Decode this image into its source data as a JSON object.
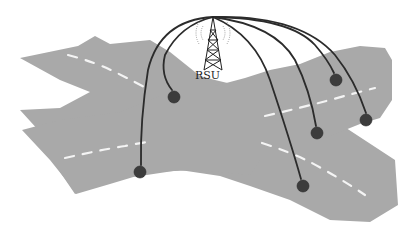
{
  "diagram": {
    "rsu": {
      "label": "RSU",
      "icon": "radio-tower-icon",
      "position": {
        "x": 213,
        "y": 17
      }
    },
    "colors": {
      "road": "#a9a9a9",
      "lane_marking": "#f4f4f4",
      "vehicle": "#3c3c3c",
      "link": "#2b2b2b",
      "background": "#ffffff"
    },
    "roads": [
      {
        "name": "diagonal-road-nw-se",
        "direction": "upper-left to lower-right"
      },
      {
        "name": "diagonal-road-sw-ne",
        "direction": "lower-left to upper-right"
      }
    ],
    "vehicles": [
      {
        "id": "v1",
        "x": 174,
        "y": 97
      },
      {
        "id": "v2",
        "x": 140,
        "y": 172
      },
      {
        "id": "v3",
        "x": 336,
        "y": 80
      },
      {
        "id": "v4",
        "x": 366,
        "y": 120
      },
      {
        "id": "v5",
        "x": 317,
        "y": 133
      },
      {
        "id": "v6",
        "x": 303,
        "y": 186
      }
    ],
    "links": [
      {
        "from": "rsu",
        "to": "v1"
      },
      {
        "from": "rsu",
        "to": "v2"
      },
      {
        "from": "rsu",
        "to": "v3"
      },
      {
        "from": "rsu",
        "to": "v4"
      },
      {
        "from": "rsu",
        "to": "v5"
      },
      {
        "from": "rsu",
        "to": "v6"
      }
    ]
  }
}
